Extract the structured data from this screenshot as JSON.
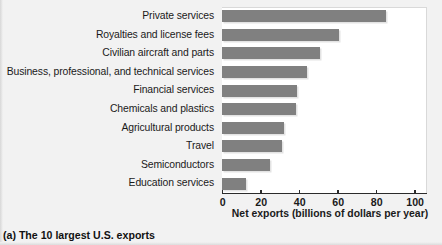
{
  "caption": "(a) The 10 largest U.S. exports",
  "chart_data": {
    "type": "bar",
    "orientation": "horizontal",
    "title": "",
    "xlabel": "Net exports (billions of dollars per year)",
    "ylabel": "",
    "xlim": [
      0,
      106
    ],
    "xticks": [
      0,
      20,
      40,
      60,
      80,
      100
    ],
    "xtick_labels": [
      "0",
      "20",
      "40",
      "60",
      "80",
      "100"
    ],
    "grid": false,
    "legend": "none",
    "bar_color": "#808080",
    "categories": [
      "Private services",
      "Royalties and license fees",
      "Civilian aircraft and parts",
      "Business, professional, and technical services",
      "Financial services",
      "Chemicals and plastics",
      "Agricultural products",
      "Travel",
      "Semiconductors",
      "Education services"
    ],
    "values": [
      85,
      61,
      51,
      44,
      39,
      38.5,
      32,
      31,
      25,
      12.5
    ]
  }
}
